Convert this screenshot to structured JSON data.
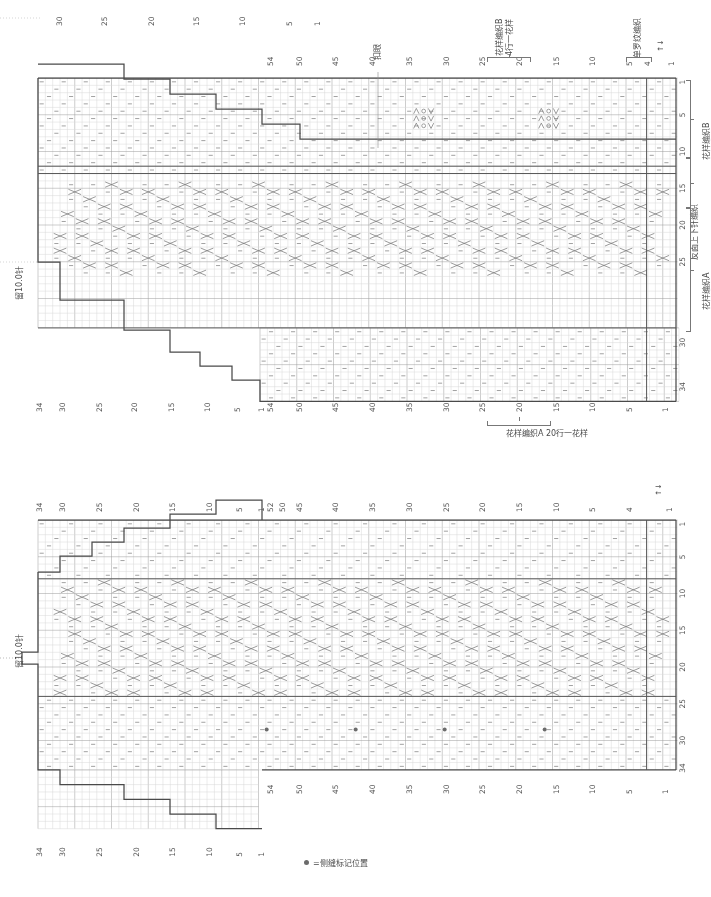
{
  "document": {
    "title": "毛衣编织图解 前身片·后身片",
    "type": "knitting-chart"
  },
  "legend": {
    "symbol": "●",
    "text": "=侧缝标记位置"
  },
  "charts": [
    {
      "id": "back-piece",
      "name": "后身片编织图",
      "hold_label": "留10.0针",
      "buttonhole_label": "扣眼",
      "top_notes": [
        {
          "text": "花样编织B",
          "sub": "4行一花样"
        },
        {
          "text": "单罗纹编织"
        }
      ],
      "right_sections": [
        {
          "label": "花样编织B",
          "rows": "1-8"
        },
        {
          "label": "反面上下针编织",
          "rows": "9-12"
        },
        {
          "label": "花样编织A",
          "rows": "13-26"
        }
      ],
      "bottom_note": "花样编织A 20行一花样",
      "top_axis_left": [
        30,
        25,
        20,
        15,
        10,
        5,
        1
      ],
      "top_axis_right": [
        54,
        50,
        45,
        40,
        35,
        30,
        25,
        20,
        15,
        10,
        5,
        4,
        1
      ],
      "bottom_axis_left": [
        34,
        30,
        25,
        20,
        15,
        10,
        5,
        1
      ],
      "bottom_axis_right": [
        54,
        50,
        45,
        40,
        35,
        30,
        25,
        20,
        15,
        10,
        5,
        1
      ],
      "row_axis_right": [
        1,
        5,
        10,
        15,
        20,
        25,
        30,
        34
      ],
      "arrows": "↑↓",
      "start_mark": "1"
    },
    {
      "id": "front-piece",
      "name": "前身片编织图",
      "hold_label": "留10.0针",
      "top_axis_left": [
        34,
        30,
        25,
        20,
        15,
        10,
        5,
        1
      ],
      "top_axis_right": [
        52,
        50,
        45,
        40,
        35,
        30,
        25,
        20,
        15,
        10,
        5,
        4,
        1
      ],
      "bottom_axis_left": [
        34,
        30,
        25,
        20,
        15,
        10,
        5,
        1
      ],
      "bottom_axis_right": [
        54,
        50,
        45,
        40,
        35,
        30,
        25,
        20,
        15,
        10,
        5,
        1
      ],
      "row_axis_right": [
        1,
        5,
        10,
        15,
        20,
        25,
        30,
        34
      ],
      "arrows": "↑↓",
      "start_mark": "1",
      "marker_dots": 4
    }
  ],
  "chart_data": {
    "type": "table",
    "grid": {
      "cell_w": 7.35,
      "cell_h": 7.35,
      "stitch_columns": 108,
      "row_count": 34,
      "gridline_major_every": 5
    },
    "symbols": [
      {
        "glyph": "-",
        "name": "下针(反面)",
        "meaning": "purl on RS / knit on WS"
      },
      {
        "glyph": "O",
        "name": "挂针",
        "meaning": "yarn over"
      },
      {
        "glyph": "人",
        "name": "左上二并一",
        "meaning": "k2tog"
      },
      {
        "glyph": "入",
        "name": "右上二并一",
        "meaning": "ssk"
      },
      {
        "glyph": "X",
        "name": "交叉针",
        "meaning": "cable cross"
      },
      {
        "glyph": "●",
        "name": "侧缝标记",
        "meaning": "side seam marker"
      }
    ],
    "series": [
      {
        "name": "后身片 (back) — 肩袖减针阶梯",
        "values": [
          30,
          25,
          20,
          15,
          10,
          5,
          1
        ]
      },
      {
        "name": "前身片 (front) — 肩袖减针阶梯",
        "values": [
          34,
          30,
          25,
          20,
          15,
          10,
          5,
          1
        ]
      }
    ]
  }
}
